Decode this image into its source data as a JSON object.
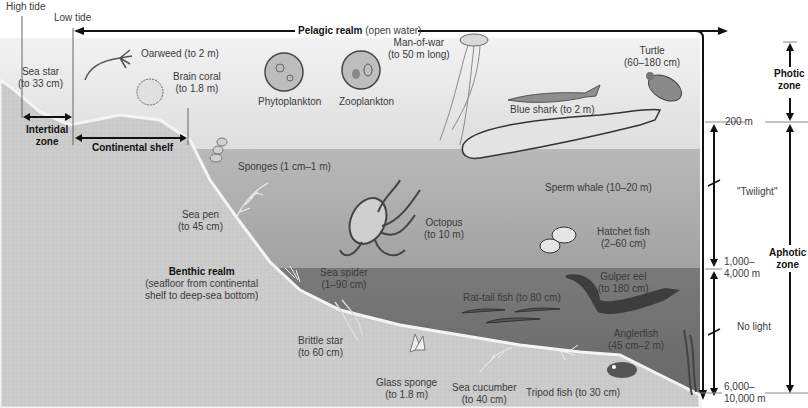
{
  "tides": {
    "high": "High tide",
    "low": "Low tide"
  },
  "realms": {
    "pelagic": {
      "name": "Pelagic realm",
      "note": "(open water)"
    },
    "benthic": {
      "name": "Benthic realm",
      "note_line1": "(seafloor from continental",
      "note_line2": "shelf to deep-sea bottom)"
    }
  },
  "zones": {
    "intertidal_line1": "Intertidal",
    "intertidal_line2": "zone",
    "continental_shelf": "Continental shelf",
    "photic_line1": "Photic",
    "photic_line2": "zone",
    "aphotic_line1": "Aphotic",
    "aphotic_line2": "zone"
  },
  "depths": {
    "d200": "200 m",
    "twilight": "\"Twilight\"",
    "d1000_line1": "1,000–",
    "d1000_line2": "4,000 m",
    "no_light": "No light",
    "d6000_line1": "6,000–",
    "d6000_line2": "10,000 m"
  },
  "organisms": [
    {
      "name": "Sea star",
      "size": "(to 33 cm)"
    },
    {
      "name": "Oarweed (to 2 m)",
      "size": ""
    },
    {
      "name": "Brain coral",
      "size": "(to 1.8 m)"
    },
    {
      "name": "Phytoplankton",
      "size": ""
    },
    {
      "name": "Zooplankton",
      "size": ""
    },
    {
      "name": "Man-of-war",
      "size": "(to 50 m long)"
    },
    {
      "name": "Blue shark (to 2 m)",
      "size": ""
    },
    {
      "name": "Turtle",
      "size": "(60–180 cm)"
    },
    {
      "name": "Sponges (1 cm–1 m)",
      "size": ""
    },
    {
      "name": "Sea pen",
      "size": "(to 45 cm)"
    },
    {
      "name": "Octopus",
      "size": "(to 10 m)"
    },
    {
      "name": "Sperm whale (10–20 m)",
      "size": ""
    },
    {
      "name": "Hatchet fish",
      "size": "(2–60 cm)"
    },
    {
      "name": "Sea spider",
      "size": "(1–90 cm)"
    },
    {
      "name": "Rat-tail fish (to 80 cm)",
      "size": ""
    },
    {
      "name": "Gulper eel",
      "size": "(to 180 cm)"
    },
    {
      "name": "Brittle star",
      "size": "(to 60 cm)"
    },
    {
      "name": "Anglerfish",
      "size": "(45 cm–2 m)"
    },
    {
      "name": "Glass sponge",
      "size": "(to 1.8 m)"
    },
    {
      "name": "Sea cucumber",
      "size": "(to 40 cm)"
    },
    {
      "name": "Tripod fish (to 30 cm)",
      "size": ""
    }
  ],
  "colors": {
    "photic_water": "#e6e6e6",
    "twilight_water": "#a8a8a8",
    "dark_water": "#6e6e6e",
    "seafloor": "#c9c9c9",
    "arrow": "#111111"
  }
}
